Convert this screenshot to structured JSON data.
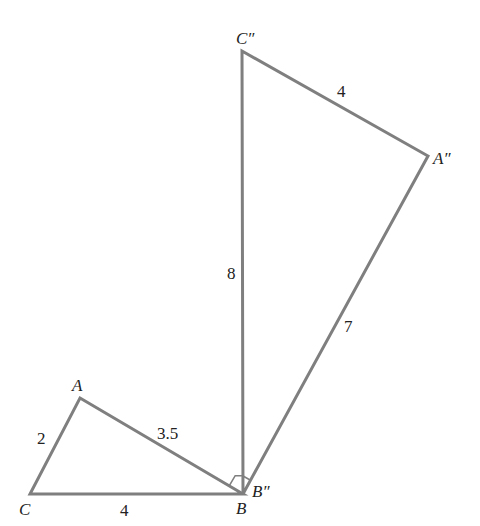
{
  "diagram": {
    "line_color": "#7f7f7f",
    "text_color": "#222222",
    "triangles": [
      {
        "name": "ABC",
        "vertices": {
          "A": {
            "label": "A",
            "x": 80,
            "y": 398
          },
          "B": {
            "label": "B",
            "x": 243,
            "y": 494
          },
          "C": {
            "label": "C",
            "x": 30,
            "y": 494
          }
        },
        "sides": [
          {
            "from": "C",
            "to": "A",
            "label": "2"
          },
          {
            "from": "A",
            "to": "B",
            "label": "3.5"
          },
          {
            "from": "C",
            "to": "B",
            "label": "4"
          }
        ]
      },
      {
        "name": "A''B''C''",
        "vertices": {
          "A2": {
            "label": "A″",
            "x": 428,
            "y": 156
          },
          "B2": {
            "label": "B″",
            "x": 243,
            "y": 494
          },
          "C2": {
            "label": "C″",
            "x": 242,
            "y": 51
          }
        },
        "sides": [
          {
            "from": "C2",
            "to": "A2",
            "label": "4"
          },
          {
            "from": "B2",
            "to": "C2",
            "label": "8"
          },
          {
            "from": "B2",
            "to": "A2",
            "label": "7"
          }
        ]
      }
    ],
    "right_angle_marker": {
      "at": "B",
      "between": [
        "BA",
        "BC''"
      ]
    },
    "labels": {
      "A": "A",
      "B": "B",
      "C": "C",
      "A2": "A″",
      "B2": "B″",
      "C2": "C″",
      "side_CA": "2",
      "side_AB": "3.5",
      "side_CB": "4",
      "side_C2A2": "4",
      "side_B2C2": "8",
      "side_B2A2": "7"
    }
  }
}
